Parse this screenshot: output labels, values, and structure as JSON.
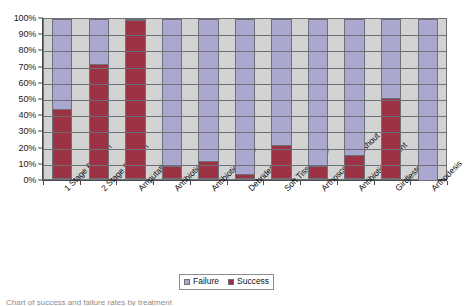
{
  "chart_data": {
    "type": "bar",
    "subtype": "stacked-percentage",
    "title": "",
    "xlabel": "",
    "ylabel": "",
    "ylim": [
      0,
      100
    ],
    "grid": true,
    "legend_position": "bottom",
    "categories": [
      "1 Stage Revision",
      "2 Stage Revision",
      "Amputation",
      "Antibiotics",
      "Antibiotic Beads",
      "Debridement",
      "Soft Tissue Flap",
      "Arthoscopic Washout",
      "Antibiotic Cement",
      "Girdlestones",
      "Arthodesis"
    ],
    "series": [
      {
        "name": "Success",
        "color": "#9c3345",
        "values": [
          43,
          71,
          98,
          8,
          11,
          3,
          21,
          8,
          15,
          50,
          0
        ]
      },
      {
        "name": "Failure",
        "color": "#aaa8ce",
        "values": [
          57,
          29,
          2,
          92,
          89,
          97,
          79,
          92,
          85,
          50,
          100
        ]
      }
    ],
    "ytick_labels": [
      "0%",
      "10%",
      "20%",
      "30%",
      "40%",
      "50%",
      "60%",
      "70%",
      "80%",
      "90%",
      "100%"
    ],
    "ytick_values": [
      0,
      10,
      20,
      30,
      40,
      50,
      60,
      70,
      80,
      90,
      100
    ]
  },
  "legend": {
    "items": [
      {
        "label": "Failure",
        "color": "#aaa8ce"
      },
      {
        "label": "Success",
        "color": "#9c3345"
      }
    ]
  },
  "caption": {
    "text": "Chart of success and failure rates by treatment"
  }
}
